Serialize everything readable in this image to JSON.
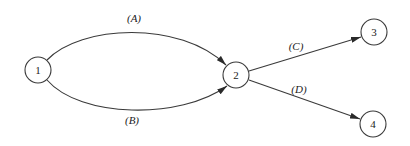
{
  "diagram": {
    "type": "activity-network",
    "nodes": [
      {
        "id": "1",
        "label": "1",
        "cx": 38,
        "cy": 70
      },
      {
        "id": "2",
        "label": "2",
        "cx": 236,
        "cy": 75
      },
      {
        "id": "3",
        "label": "3",
        "cx": 374,
        "cy": 32
      },
      {
        "id": "4",
        "label": "4",
        "cx": 373,
        "cy": 124
      }
    ],
    "edges": [
      {
        "from": "1",
        "to": "2",
        "label": "(A)"
      },
      {
        "from": "1",
        "to": "2",
        "label": "(B)"
      },
      {
        "from": "2",
        "to": "3",
        "label": "(C)"
      },
      {
        "from": "2",
        "to": "4",
        "label": "(D)"
      }
    ]
  },
  "labels": {
    "node1": "1",
    "node2": "2",
    "node3": "3",
    "node4": "4",
    "edgeA": "(A)",
    "edgeB": "(B)",
    "edgeC": "(C)",
    "edgeD": "(D)"
  },
  "colors": {
    "stroke": "#3a3a3a",
    "background": "#ffffff"
  }
}
